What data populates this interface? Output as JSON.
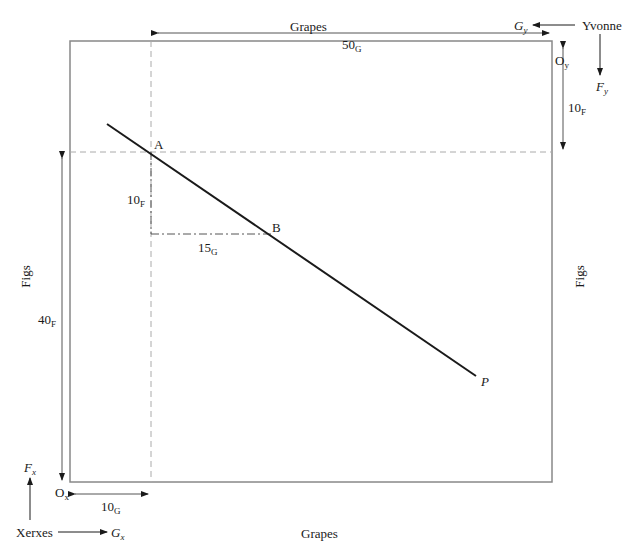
{
  "diagram": {
    "type": "edgeworth-box",
    "axes": {
      "top_label": "Grapes",
      "bottom_label": "Grapes",
      "left_label": "Figs",
      "right_label": "Figs"
    },
    "origins": {
      "xerxes": {
        "base": "O",
        "sub": "x"
      },
      "yvonne": {
        "base": "O",
        "sub": "y"
      }
    },
    "agents": {
      "xerxes": {
        "name": "Xerxes",
        "goods_x": {
          "base": "G",
          "sub": "x"
        },
        "goods_y": {
          "base": "F",
          "sub": "x"
        }
      },
      "yvonne": {
        "name": "Yvonne",
        "goods_x": {
          "base": "G",
          "sub": "y"
        },
        "goods_y": {
          "base": "F",
          "sub": "y"
        }
      }
    },
    "dimensions": {
      "width_top": {
        "value": "50",
        "unit": "G"
      },
      "yvonne_figs": {
        "value": "10",
        "unit": "F"
      },
      "xerxes_figs": {
        "value": "40",
        "unit": "F"
      },
      "xerxes_grapes": {
        "value": "10",
        "unit": "G"
      },
      "delta_figs": {
        "value": "10",
        "unit": "F"
      },
      "delta_grapes": {
        "value": "15",
        "unit": "G"
      }
    },
    "points": {
      "A": "A",
      "B": "B",
      "P": "P"
    }
  }
}
